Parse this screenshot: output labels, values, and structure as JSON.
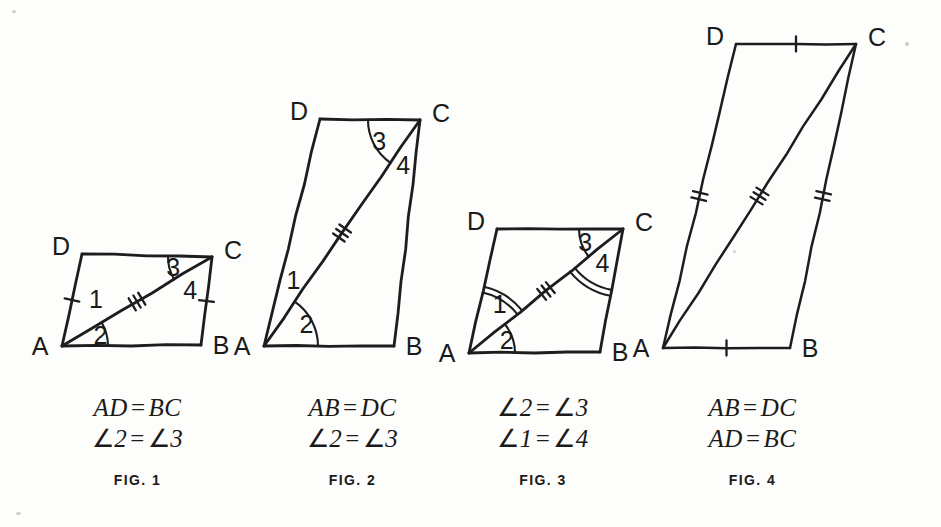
{
  "page": {
    "background_color": "#fdfdfb",
    "ink_color": "#1d1d1f"
  },
  "figures": [
    {
      "id": "fig1",
      "name": "FIG. 1",
      "vertices": {
        "A": "A",
        "B": "B",
        "C": "C",
        "D": "D"
      },
      "points": {
        "A": [
          62,
          346
        ],
        "B": [
          201,
          345
        ],
        "C": [
          212,
          257
        ],
        "D": [
          82,
          254
        ]
      },
      "angle_labels": [
        "1",
        "2",
        "3",
        "4"
      ],
      "tick_marks": [
        {
          "side": "AD",
          "count": 1
        },
        {
          "side": "BC",
          "count": 1
        },
        {
          "side": "AC",
          "count": 3
        }
      ],
      "arcs": [
        {
          "angle": "2",
          "count": 1
        },
        {
          "angle": "3",
          "count": 1
        }
      ],
      "given": [
        "AD = BC",
        "∠2 = ∠3"
      ],
      "given_parts": [
        {
          "left": "AD",
          "right": "BC",
          "kind": "segment"
        },
        {
          "left": "2",
          "right": "3",
          "kind": "angle"
        }
      ]
    },
    {
      "id": "fig2",
      "name": "FIG. 2",
      "vertices": {
        "A": "A",
        "B": "B",
        "C": "C",
        "D": "D"
      },
      "points": {
        "A": [
          264,
          346
        ],
        "B": [
          394,
          346
        ],
        "C": [
          420,
          120
        ],
        "D": [
          320,
          119
        ]
      },
      "angle_labels": [
        "1",
        "2",
        "3",
        "4"
      ],
      "tick_marks": [
        {
          "side": "AC",
          "count": 3
        }
      ],
      "arcs": [
        {
          "angle": "2",
          "count": 1
        },
        {
          "angle": "3",
          "count": 1
        }
      ],
      "given": [
        "AB = DC",
        "∠2 = ∠3"
      ],
      "given_parts": [
        {
          "left": "AB",
          "right": "DC",
          "kind": "segment"
        },
        {
          "left": "2",
          "right": "3",
          "kind": "angle"
        }
      ]
    },
    {
      "id": "fig3",
      "name": "FIG. 3",
      "vertices": {
        "A": "A",
        "B": "B",
        "C": "C",
        "D": "D"
      },
      "points": {
        "A": [
          469,
          353
        ],
        "B": [
          600,
          352
        ],
        "C": [
          623,
          229
        ],
        "D": [
          497,
          229
        ]
      },
      "angle_labels": [
        "1",
        "2",
        "3",
        "4"
      ],
      "tick_marks": [
        {
          "side": "AC",
          "count": 3
        }
      ],
      "arcs": [
        {
          "angle": "1",
          "count": 2
        },
        {
          "angle": "2",
          "count": 1
        },
        {
          "angle": "3",
          "count": 1
        },
        {
          "angle": "4",
          "count": 2
        }
      ],
      "given": [
        "∠2 = ∠3",
        "∠1 = ∠4"
      ],
      "given_parts": [
        {
          "left": "2",
          "right": "3",
          "kind": "angle"
        },
        {
          "left": "1",
          "right": "4",
          "kind": "angle"
        }
      ]
    },
    {
      "id": "fig4",
      "name": "FIG. 4",
      "vertices": {
        "A": "A",
        "B": "B",
        "C": "C",
        "D": "D"
      },
      "points": {
        "A": [
          663,
          348
        ],
        "B": [
          790,
          348
        ],
        "C": [
          856,
          44
        ],
        "D": [
          736,
          44
        ]
      },
      "angle_labels": [],
      "tick_marks": [
        {
          "side": "AB",
          "count": 1
        },
        {
          "side": "DC",
          "count": 1
        },
        {
          "side": "AD",
          "count": 2
        },
        {
          "side": "BC",
          "count": 2
        },
        {
          "side": "AC",
          "count": 3
        }
      ],
      "arcs": [],
      "given": [
        "AB = DC",
        "AD = BC"
      ],
      "given_parts": [
        {
          "left": "AB",
          "right": "DC",
          "kind": "segment"
        },
        {
          "left": "AD",
          "right": "BC",
          "kind": "segment"
        }
      ]
    }
  ],
  "captions": [
    {
      "line1": "AD = BC",
      "line2": "∠2 = ∠3",
      "fig": "FIG. 1",
      "left": 30,
      "top": 392,
      "width": 215
    },
    {
      "line1": "AB = DC",
      "line2": "∠2 = ∠3",
      "fig": "FIG. 2",
      "left": 245,
      "top": 392,
      "width": 215
    },
    {
      "line1": "∠2 = ∠3",
      "line2": "∠1 = ∠4",
      "fig": "FIG. 3",
      "left": 443,
      "top": 392,
      "width": 200
    },
    {
      "line1": "AB = DC",
      "line2": "AD = BC",
      "fig": "FIG. 4",
      "left": 645,
      "top": 392,
      "width": 215
    }
  ],
  "equality_symbol": "=",
  "angle_symbol": "∠"
}
